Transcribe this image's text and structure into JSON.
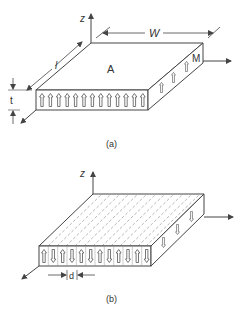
{
  "figure": {
    "panel_a": {
      "caption": "(a)",
      "axis_label_z": "z",
      "dimension_width": "W",
      "dimension_length": "l",
      "dimension_thickness": "t",
      "surface_label": "A",
      "magnetization_label": "M",
      "front_face_arrows": [
        "up",
        "up",
        "up",
        "up",
        "up",
        "up",
        "up",
        "up",
        "up",
        "up",
        "up",
        "up",
        "up"
      ],
      "side_face_arrows": [
        "up",
        "up",
        "up",
        "up"
      ]
    },
    "panel_b": {
      "caption": "(b)",
      "axis_label_z": "z",
      "dimension_domain": "d",
      "front_face_arrows": [
        "up",
        "down",
        "up",
        "down",
        "up",
        "down",
        "up",
        "down",
        "up",
        "down",
        "up",
        "down"
      ],
      "side_face_arrows": [
        "down",
        "down",
        "down"
      ],
      "top_face_pattern": "dashed-stripes"
    },
    "colors": {
      "line": "#444444",
      "text": "#333333",
      "hatch": "#888888",
      "background": "#ffffff"
    }
  }
}
